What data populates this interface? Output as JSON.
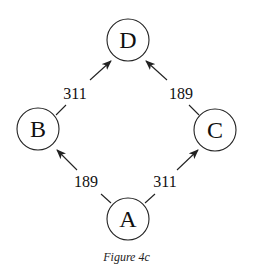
{
  "figure": {
    "caption": "Figure 4c"
  },
  "nodes": [
    {
      "id": "D",
      "label": "D",
      "cx": 128,
      "cy": 40,
      "r": 21
    },
    {
      "id": "B",
      "label": "B",
      "cx": 38,
      "cy": 129,
      "r": 21
    },
    {
      "id": "C",
      "label": "C",
      "cx": 215,
      "cy": 130,
      "r": 21
    },
    {
      "id": "A",
      "label": "A",
      "cx": 128,
      "cy": 219,
      "r": 21
    }
  ],
  "edges": [
    {
      "from": "B",
      "to": "D",
      "weight": "311",
      "label_x": 75,
      "label_y": 99
    },
    {
      "from": "C",
      "to": "D",
      "weight": "189",
      "label_x": 181,
      "label_y": 99
    },
    {
      "from": "A",
      "to": "B",
      "weight": "189",
      "label_x": 86,
      "label_y": 187
    },
    {
      "from": "A",
      "to": "C",
      "weight": "311",
      "label_x": 165,
      "label_y": 187
    }
  ],
  "colors": {
    "stroke": "#222222",
    "text": "#111111",
    "background": "#ffffff"
  }
}
